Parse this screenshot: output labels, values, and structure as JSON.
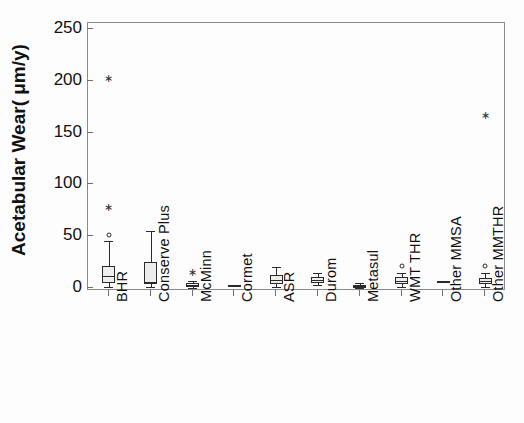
{
  "chart_data": {
    "type": "box",
    "title": "",
    "xlabel": "",
    "ylabel": "Acetabular Wear( μm/y)",
    "ylim": [
      0,
      262
    ],
    "yticks": [
      0,
      50,
      100,
      150,
      200,
      250
    ],
    "ytick_labels": [
      "0",
      "50",
      "100",
      "150",
      "200",
      "250"
    ],
    "grid": false,
    "legend": "none",
    "categories": [
      "BHR",
      "Conserve Plus",
      "McMinn",
      "Cormet",
      "ASR",
      "Durom",
      "Metasul",
      "WMT THR",
      "Other MMSA",
      "Other MMTHR"
    ],
    "boxes": [
      {
        "category": "BHR",
        "whisker_low": 1,
        "q1": 5,
        "median": 12,
        "q3": 21,
        "whisker_high": 45,
        "outliers_circle": [
          51
        ],
        "outliers_star": [
          78,
          203
        ]
      },
      {
        "category": "Conserve Plus",
        "whisker_low": 1,
        "q1": 4,
        "median": 6,
        "q3": 25,
        "whisker_high": 55,
        "outliers_circle": [],
        "outliers_star": []
      },
      {
        "category": "McMinn",
        "whisker_low": 0,
        "q1": 1,
        "median": 3,
        "q3": 5,
        "whisker_high": 7,
        "outliers_circle": [],
        "outliers_star": [
          15
        ]
      },
      {
        "category": "Cormet",
        "whisker_low": 3,
        "q1": 3,
        "median": 3,
        "q3": 3,
        "whisker_high": 3,
        "outliers_circle": [],
        "outliers_star": [],
        "flat": true
      },
      {
        "category": "ASR",
        "whisker_low": 1,
        "q1": 4,
        "median": 8,
        "q3": 13,
        "whisker_high": 20,
        "outliers_circle": [],
        "outliers_star": []
      },
      {
        "category": "Durom",
        "whisker_low": 3,
        "q1": 5,
        "median": 8,
        "q3": 11,
        "whisker_high": 14,
        "outliers_circle": [],
        "outliers_star": []
      },
      {
        "category": "Metasul",
        "whisker_low": 0,
        "q1": 1,
        "median": 2,
        "q3": 3,
        "whisker_high": 5,
        "outliers_circle": [],
        "outliers_star": []
      },
      {
        "category": "WMT THR",
        "whisker_low": 1,
        "q1": 4,
        "median": 7,
        "q3": 11,
        "whisker_high": 14,
        "outliers_circle": [
          21
        ],
        "outliers_star": []
      },
      {
        "category": "Other MMSA",
        "whisker_low": 7,
        "q1": 7,
        "median": 7,
        "q3": 7,
        "whisker_high": 7,
        "outliers_circle": [],
        "outliers_star": [],
        "flat": true
      },
      {
        "category": "Other MMTHR",
        "whisker_low": 1,
        "q1": 4,
        "median": 7,
        "q3": 10,
        "whisker_high": 14,
        "outliers_circle": [
          21
        ],
        "outliers_star": [
          167
        ]
      }
    ]
  },
  "axis": {
    "y_title": "Acetabular Wear( μm/y)"
  }
}
